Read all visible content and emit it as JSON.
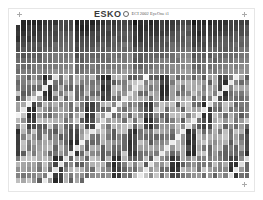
{
  "header": {
    "logo": "ESKO",
    "title": "ECI 2002 EyeOne i1"
  },
  "chart": {
    "columns": 44,
    "rows": 30,
    "last_row_patches": 13,
    "patch_width": 4.3,
    "patch_height": 5.2,
    "col_pitch": 5.32,
    "row_pitch": 5.45,
    "first_patch_color": "#ffffff"
  }
}
